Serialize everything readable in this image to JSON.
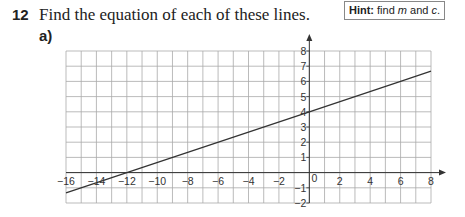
{
  "question": {
    "number": "12",
    "text": "Find the equation of each of these lines.",
    "part_label": "a)"
  },
  "hint": {
    "label": "Hint:",
    "text_before": " find ",
    "m": "m",
    "text_middle": " and ",
    "c": "c",
    "text_after": "."
  },
  "chart_data": {
    "type": "line",
    "title": "",
    "xlabel": "",
    "ylabel": "",
    "xlim": [
      -16,
      8
    ],
    "ylim": [
      -2,
      8
    ],
    "grid": true,
    "x_ticks": [
      -16,
      -14,
      -12,
      -10,
      -8,
      -6,
      -4,
      -2,
      0,
      2,
      4,
      6,
      8
    ],
    "y_ticks": [
      -2,
      -1,
      1,
      2,
      3,
      4,
      5,
      6,
      7,
      8
    ],
    "series": [
      {
        "name": "line",
        "equation": "y = x/3 + 4",
        "x": [
          -16,
          -12,
          0,
          3,
          6,
          8
        ],
        "y": [
          -1.33,
          0,
          4,
          5,
          6,
          6.67
        ]
      }
    ]
  },
  "colors": {
    "grid": "#aaaaaa",
    "axis": "#333333",
    "line": "#333333"
  }
}
